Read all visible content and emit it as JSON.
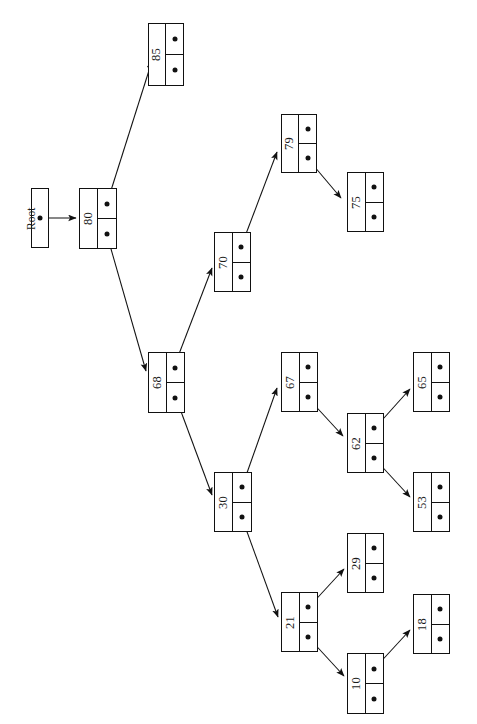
{
  "figure": {
    "orientation": "rotated-90-ccw",
    "root_label": "Root",
    "top_smudge": "   ",
    "canvas": {
      "width": 477,
      "height": 724
    },
    "ink_color": "#111111",
    "paper_color": "#ffffff"
  },
  "root_pointer": {
    "name": "root-pointer-box",
    "x": 31,
    "y": 188,
    "w": 18,
    "h": 60,
    "dot_label": "•"
  },
  "nodes": [
    {
      "id": "n85",
      "key": "85",
      "x": 148,
      "y": 23,
      "w": 36,
      "h": 63
    },
    {
      "id": "n80",
      "key": "80",
      "x": 79,
      "y": 188,
      "w": 38,
      "h": 61
    },
    {
      "id": "n79",
      "key": "79",
      "x": 281,
      "y": 114,
      "w": 36,
      "h": 59
    },
    {
      "id": "n75",
      "key": "75",
      "x": 347,
      "y": 172,
      "w": 37,
      "h": 60
    },
    {
      "id": "n70",
      "key": "70",
      "x": 214,
      "y": 232,
      "w": 37,
      "h": 60
    },
    {
      "id": "n68",
      "key": "68",
      "x": 148,
      "y": 352,
      "w": 37,
      "h": 61
    },
    {
      "id": "n67",
      "key": "67",
      "x": 281,
      "y": 352,
      "w": 37,
      "h": 60
    },
    {
      "id": "n62",
      "key": "62",
      "x": 347,
      "y": 413,
      "w": 37,
      "h": 60
    },
    {
      "id": "n65",
      "key": "65",
      "x": 413,
      "y": 352,
      "w": 37,
      "h": 60
    },
    {
      "id": "n53",
      "key": "53",
      "x": 413,
      "y": 472,
      "w": 37,
      "h": 60
    },
    {
      "id": "n30",
      "key": "30",
      "x": 214,
      "y": 472,
      "w": 38,
      "h": 60
    },
    {
      "id": "n21",
      "key": "21",
      "x": 281,
      "y": 592,
      "w": 37,
      "h": 60
    },
    {
      "id": "n29",
      "key": "29",
      "x": 347,
      "y": 533,
      "w": 37,
      "h": 60
    },
    {
      "id": "n10",
      "key": "10",
      "x": 347,
      "y": 653,
      "w": 37,
      "h": 61
    },
    {
      "id": "n18",
      "key": "18",
      "x": 413,
      "y": 594,
      "w": 37,
      "h": 60
    }
  ],
  "edges": [
    {
      "name": "edge-root-to-80",
      "from": "root",
      "to": "n80",
      "x1": 40,
      "y1": 218,
      "x2": 76,
      "y2": 218
    },
    {
      "name": "edge-80-left-to-85",
      "from": "n80",
      "to": "n85",
      "x1": 107,
      "y1": 203,
      "x2": 152,
      "y2": 61
    },
    {
      "name": "edge-80-right-to-68",
      "from": "n80",
      "to": "n68",
      "x1": 107,
      "y1": 235,
      "x2": 146,
      "y2": 371
    },
    {
      "name": "edge-68-right-to-30",
      "from": "n68",
      "to": "n30",
      "x1": 176,
      "y1": 398,
      "x2": 212,
      "y2": 495
    },
    {
      "name": "edge-68-left-to-70",
      "from": "n68",
      "to": "n70",
      "x1": 174,
      "y1": 367,
      "x2": 212,
      "y2": 268
    },
    {
      "name": "edge-70-left-to-79",
      "from": "n70",
      "to": "n79",
      "x1": 241,
      "y1": 247,
      "x2": 277,
      "y2": 152
    },
    {
      "name": "edge-79-right-to-75",
      "from": "n79",
      "to": "n75",
      "x1": 308,
      "y1": 159,
      "x2": 341,
      "y2": 198
    },
    {
      "name": "edge-30-left-to-67",
      "from": "n30",
      "to": "n67",
      "x1": 242,
      "y1": 487,
      "x2": 277,
      "y2": 388
    },
    {
      "name": "edge-30-right-to-21",
      "from": "n30",
      "to": "n21",
      "x1": 242,
      "y1": 518,
      "x2": 278,
      "y2": 617
    },
    {
      "name": "edge-67-right-to-62",
      "from": "n67",
      "to": "n62",
      "x1": 308,
      "y1": 398,
      "x2": 343,
      "y2": 436
    },
    {
      "name": "edge-62-left-to-65",
      "from": "n62",
      "to": "n65",
      "x1": 375,
      "y1": 428,
      "x2": 410,
      "y2": 389
    },
    {
      "name": "edge-62-right-to-53",
      "from": "n62",
      "to": "n53",
      "x1": 375,
      "y1": 459,
      "x2": 410,
      "y2": 497
    },
    {
      "name": "edge-21-left-to-29",
      "from": "n21",
      "to": "n29",
      "x1": 309,
      "y1": 607,
      "x2": 344,
      "y2": 569
    },
    {
      "name": "edge-21-right-to-10",
      "from": "n21",
      "to": "n10",
      "x1": 309,
      "y1": 638,
      "x2": 344,
      "y2": 676
    },
    {
      "name": "edge-10-left-to-18",
      "from": "n10",
      "to": "n18",
      "x1": 375,
      "y1": 668,
      "x2": 410,
      "y2": 630
    }
  ],
  "tree_structure": {
    "root": "80",
    "adjacency": {
      "80": {
        "left": "85",
        "right": "68"
      },
      "85": {
        "left": null,
        "right": null
      },
      "68": {
        "left": "70",
        "right": "30"
      },
      "70": {
        "left": "79",
        "right": null
      },
      "79": {
        "left": null,
        "right": "75"
      },
      "75": {
        "left": null,
        "right": null
      },
      "30": {
        "left": "67",
        "right": "21"
      },
      "67": {
        "left": null,
        "right": "62"
      },
      "62": {
        "left": "65",
        "right": "53"
      },
      "65": {
        "left": null,
        "right": null
      },
      "53": {
        "left": null,
        "right": null
      },
      "21": {
        "left": "29",
        "right": "10"
      },
      "29": {
        "left": null,
        "right": null
      },
      "10": {
        "left": "18",
        "right": null
      },
      "18": {
        "left": null,
        "right": null
      }
    }
  }
}
